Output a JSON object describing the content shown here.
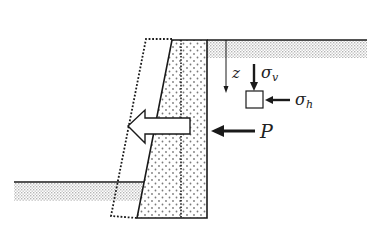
{
  "diagram": {
    "type": "retaining-wall-earth-pressure",
    "labels": {
      "depth": "z",
      "vertical_stress": "σ",
      "vertical_stress_sub": "v",
      "horizontal_stress": "σ",
      "horizontal_stress_sub": "h",
      "resultant_force": "P"
    },
    "colors": {
      "line": "#1a1a1a",
      "stipple": "#bdbdbd",
      "wall_dot": "#8a8a8a",
      "background": "#ffffff"
    }
  }
}
